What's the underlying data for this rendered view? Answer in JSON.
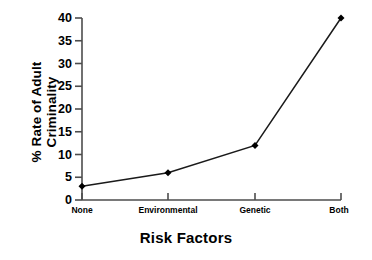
{
  "chart_data": {
    "type": "line",
    "title": "",
    "xlabel": "Risk Factors",
    "ylabel_lines": [
      "% Rate of Adult",
      "Criminality"
    ],
    "ylabel": "% Rate of Adult Criminality",
    "categories": [
      "None",
      "Environmental",
      "Genetic",
      "Both"
    ],
    "values": [
      3,
      6,
      12,
      40
    ],
    "series": [
      {
        "name": "Rate of Adult Criminality",
        "values": [
          3,
          6,
          12,
          40
        ]
      }
    ],
    "ylim": [
      0,
      40
    ],
    "yticks": [
      0,
      5,
      10,
      15,
      20,
      25,
      30,
      35,
      40
    ],
    "ytick_labels": [
      "0",
      "5",
      "10",
      "15",
      "20",
      "25",
      "30",
      "35",
      "40"
    ],
    "grid": false,
    "legend": false,
    "legend_position": "none",
    "marker": "diamond",
    "line_color": "#1a1a1a",
    "marker_color": "#000000",
    "background_color": "#ffffff",
    "axis_color": "#4d4d4d"
  }
}
